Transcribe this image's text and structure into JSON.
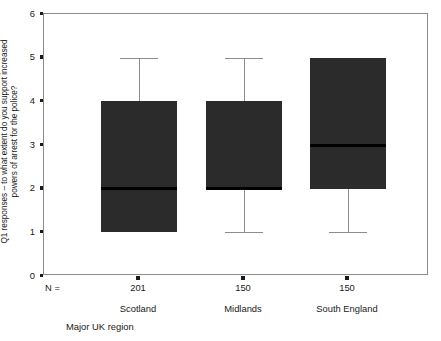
{
  "chart_data": {
    "type": "box",
    "title": "",
    "xlabel": "Major UK region",
    "ylabel_line1": "Q1 responses – to what extent do you support increased",
    "ylabel_line2": "powers of arrest for the police?",
    "ylim": [
      0,
      6
    ],
    "yticks": [
      0,
      1,
      2,
      3,
      4,
      5,
      6
    ],
    "ytick_labels": [
      "0",
      "1",
      "2",
      "3",
      "4",
      "5",
      "6"
    ],
    "grid": false,
    "legend": "none",
    "n_label": "N =",
    "categories": [
      "Scotland",
      "Midlands",
      "South England"
    ],
    "n_values": [
      "201",
      "150",
      "150"
    ],
    "boxes": [
      {
        "category": "Scotland",
        "n": 201,
        "q1": 1,
        "median": 2,
        "q3": 4,
        "whisker_low": 1,
        "whisker_high": 5,
        "has_low_whisker": false,
        "has_high_whisker": true
      },
      {
        "category": "Midlands",
        "n": 150,
        "q1": 2,
        "median": 2,
        "q3": 4,
        "whisker_low": 1,
        "whisker_high": 5,
        "has_low_whisker": true,
        "has_high_whisker": true
      },
      {
        "category": "South England",
        "n": 150,
        "q1": 2,
        "median": 3,
        "q3": 5,
        "whisker_low": 1,
        "whisker_high": 5,
        "has_low_whisker": true,
        "has_high_whisker": false
      }
    ],
    "colors": {
      "box_fill": "#2b2b2b",
      "median": "#000000",
      "whisker": "#8c8c8c",
      "axis": "#8c8c8c",
      "text": "#1a1a1a",
      "background": "#ffffff"
    }
  }
}
